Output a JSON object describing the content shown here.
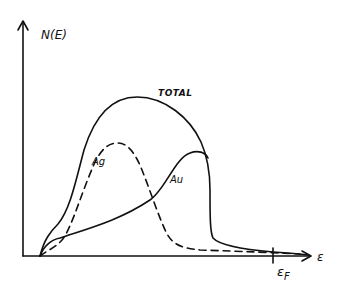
{
  "diagram": {
    "type": "density-of-states sketch",
    "axes": {
      "y_label": "N(E)",
      "x_label": "ε"
    },
    "curves": [
      {
        "name": "TOTAL",
        "style": "solid",
        "label": "TOTAL"
      },
      {
        "name": "Ag",
        "style": "dashed",
        "label": "Ag"
      },
      {
        "name": "Au",
        "style": "solid",
        "label": "Au"
      }
    ],
    "marker": {
      "label": "ε",
      "subscript": "F"
    }
  }
}
